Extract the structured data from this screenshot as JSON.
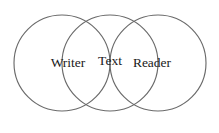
{
  "diagram": {
    "type": "venn-three-circle",
    "background_color": "#ffffff",
    "stroke_color": "#6a6a6a",
    "text_color": "#1a1a1a",
    "circles": [
      {
        "id": "writer-circle",
        "name": "Writer",
        "cx": 62,
        "cy": 63,
        "r": 48
      },
      {
        "id": "text-circle",
        "name": "Text",
        "cx": 110,
        "cy": 63,
        "r": 48
      },
      {
        "id": "reader-circle",
        "name": "Reader",
        "cx": 158,
        "cy": 63,
        "r": 48
      }
    ],
    "labels": {
      "left": "Writer",
      "center": "Text",
      "right": "Reader"
    },
    "label_positions": {
      "left": {
        "x": 68,
        "y": 64
      },
      "center": {
        "x": 110,
        "y": 62
      },
      "right": {
        "x": 152,
        "y": 64
      }
    }
  }
}
